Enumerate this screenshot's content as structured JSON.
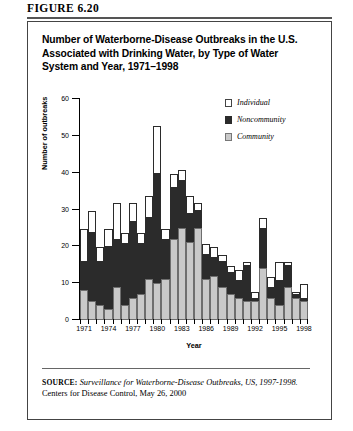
{
  "figure": {
    "label": "FIGURE 6.20",
    "title": "Number of Waterborne-Disease Outbreaks in the U.S. Associated with Drinking Water, by Type of Water System and Year, 1971–1998"
  },
  "source": {
    "key": "SOURCE:",
    "italic_part": "Surveillance for Waterborne-Disease Outbreaks, US, 1997-1998.",
    "rest": " Centers for Disease Control, May 26, 2000"
  },
  "legend": {
    "position": "top-right",
    "items": [
      {
        "label": "Individual",
        "color": "#ffffff",
        "swatch": "individual-swatch"
      },
      {
        "label": "Noncommunity",
        "color": "#2b2b2b",
        "swatch": "noncommunity-swatch"
      },
      {
        "label": "Community",
        "color": "#c9c9c9",
        "swatch": "community-swatch"
      }
    ]
  },
  "chart_data": {
    "type": "bar",
    "stacked": true,
    "title": "Number of Waterborne-Disease Outbreaks in the U.S. Associated with Drinking Water, by Type of Water System and Year, 1971–1998",
    "xlabel": "Year",
    "ylabel": "Number of outbreaks",
    "ylim": [
      0,
      60
    ],
    "yticks": [
      0,
      10,
      20,
      30,
      40,
      50,
      60
    ],
    "xtick_labels": [
      "1971",
      "1974",
      "1977",
      "1980",
      "1983",
      "1986",
      "1989",
      "1992",
      "1995",
      "1998"
    ],
    "grid": false,
    "categories": [
      "1971",
      "1972",
      "1973",
      "1974",
      "1975",
      "1976",
      "1977",
      "1978",
      "1979",
      "1980",
      "1981",
      "1982",
      "1983",
      "1984",
      "1985",
      "1986",
      "1987",
      "1988",
      "1989",
      "1990",
      "1991",
      "1992",
      "1993",
      "1994",
      "1995",
      "1996",
      "1997",
      "1998"
    ],
    "series": [
      {
        "name": "Community",
        "color": "#c9c9c9",
        "values": [
          8,
          5,
          4,
          3,
          9,
          4,
          6,
          7,
          11,
          10,
          11,
          22,
          25,
          21,
          25,
          11,
          12,
          9,
          7,
          6,
          5,
          5,
          14,
          6,
          4,
          9,
          6,
          5
        ]
      },
      {
        "name": "Noncommunity",
        "color": "#2b2b2b",
        "values": [
          8,
          19,
          12,
          17,
          13,
          17,
          21,
          14,
          17,
          30,
          11,
          14,
          13,
          8,
          5,
          7,
          5,
          7,
          6,
          5,
          10,
          1,
          11,
          3,
          7,
          6,
          1,
          1
        ]
      },
      {
        "name": "Individual",
        "color": "#ffffff",
        "values": [
          9,
          6,
          4,
          5,
          10,
          3,
          5,
          3,
          6,
          13,
          3,
          4,
          3,
          5,
          2,
          3,
          3,
          2,
          2,
          3,
          1,
          2,
          3,
          3,
          5,
          1,
          1,
          4
        ]
      }
    ],
    "totals": [
      25,
      30,
      20,
      25,
      32,
      24,
      32,
      24,
      34,
      53,
      25,
      40,
      41,
      34,
      32,
      21,
      20,
      18,
      15,
      14,
      16,
      8,
      28,
      12,
      16,
      16,
      8,
      10
    ]
  }
}
